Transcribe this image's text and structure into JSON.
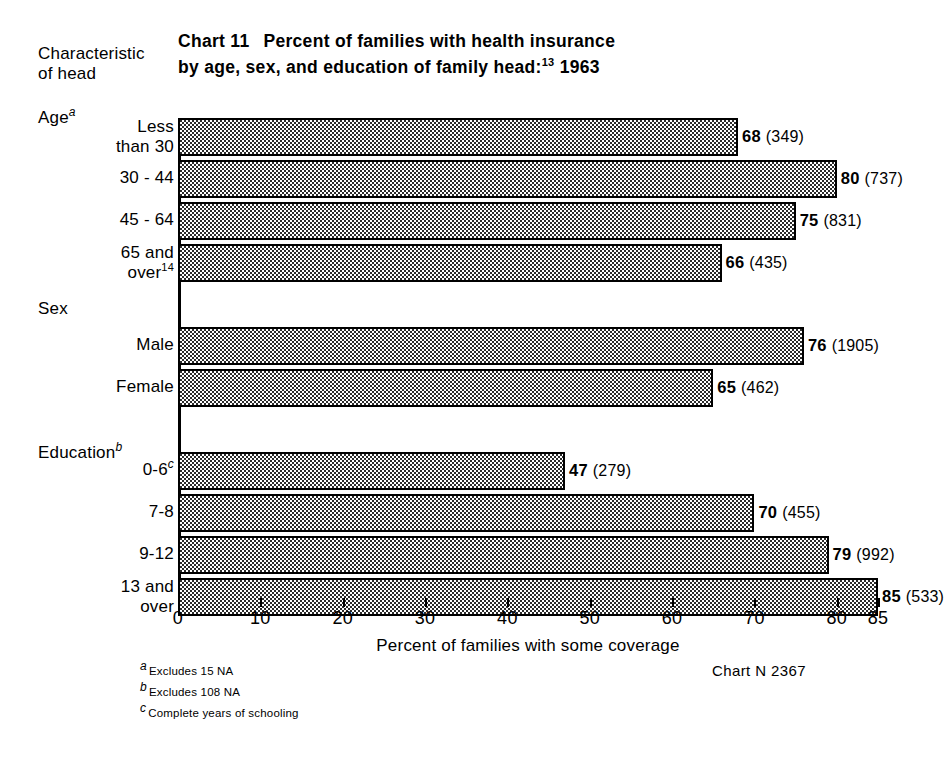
{
  "header": {
    "axis_caption_line1": "Characteristic",
    "axis_caption_line2": "of head",
    "chart_number": "Chart 11",
    "title_line1": "Percent of families with health insurance",
    "title_line2_a": "by age, sex, and education of family head:",
    "title_line2_footnote": "13",
    "title_line2_year": "1963"
  },
  "groups": [
    {
      "name": "Age",
      "footnote": "a"
    },
    {
      "name": "Sex",
      "footnote": ""
    },
    {
      "name": "Education",
      "footnote": "b"
    }
  ],
  "footnotes": [
    {
      "mark": "a",
      "text": "Excludes 15 NA"
    },
    {
      "mark": "b",
      "text": "Excludes 108 NA"
    },
    {
      "mark": "c",
      "text": "Complete years of schooling"
    }
  ],
  "chart_id": "Chart N   2367",
  "chart_data": {
    "type": "bar",
    "orientation": "horizontal",
    "xlabel": "Percent of families with some coverage",
    "ylabel": "Characteristic of head",
    "xlim": [
      0,
      85
    ],
    "xticks": [
      0,
      10,
      20,
      30,
      40,
      50,
      60,
      70,
      80,
      85
    ],
    "xticklabels": [
      "0",
      "10",
      "20",
      "30",
      "40",
      "50",
      "60",
      "70",
      "80",
      "85"
    ],
    "grid": false,
    "legend": "none",
    "groups": [
      "Age",
      "Sex",
      "Education"
    ],
    "categories": [
      "Less than 30",
      "30 - 44",
      "45 - 64",
      "65 and over14",
      "Male",
      "Female",
      "0-6c",
      "7-8",
      "9-12",
      "13 and over"
    ],
    "values": [
      68,
      80,
      75,
      66,
      76,
      65,
      47,
      70,
      79,
      85
    ],
    "counts": [
      349,
      737,
      831,
      435,
      1905,
      462,
      279,
      455,
      992,
      533
    ],
    "bars": [
      {
        "group": "Age",
        "label_line1": "Less",
        "label_line2": "than 30",
        "label_sup": "",
        "value": 68,
        "value_text": "68",
        "count_text": "(349)"
      },
      {
        "group": "Age",
        "label_line1": "30 - 44",
        "label_line2": "",
        "label_sup": "",
        "value": 80,
        "value_text": "80",
        "count_text": "(737)"
      },
      {
        "group": "Age",
        "label_line1": "45 - 64",
        "label_line2": "",
        "label_sup": "",
        "value": 75,
        "value_text": "75",
        "count_text": "(831)"
      },
      {
        "group": "Age",
        "label_line1": "65 and",
        "label_line2": "over",
        "label_sup": "14",
        "value": 66,
        "value_text": "66",
        "count_text": "(435)"
      },
      {
        "group": "Sex",
        "label_line1": "Male",
        "label_line2": "",
        "label_sup": "",
        "value": 76,
        "value_text": "76",
        "count_text": "(1905)"
      },
      {
        "group": "Sex",
        "label_line1": "Female",
        "label_line2": "",
        "label_sup": "",
        "value": 65,
        "value_text": "65",
        "count_text": "(462)"
      },
      {
        "group": "Education",
        "label_line1": "0-6",
        "label_line2": "",
        "label_sup": "c",
        "value": 47,
        "value_text": "47",
        "count_text": "(279)"
      },
      {
        "group": "Education",
        "label_line1": "7-8",
        "label_line2": "",
        "label_sup": "",
        "value": 70,
        "value_text": "70",
        "count_text": "(455)"
      },
      {
        "group": "Education",
        "label_line1": "9-12",
        "label_line2": "",
        "label_sup": "",
        "value": 79,
        "value_text": "79",
        "count_text": "(992)"
      },
      {
        "group": "Education",
        "label_line1": "13 and",
        "label_line2": "over",
        "label_sup": "",
        "value": 85,
        "value_text": "85",
        "count_text": "(533)"
      }
    ]
  },
  "colors": {
    "ink": "#000000",
    "page": "#ffffff",
    "bar_fill": "#e9e9e9"
  }
}
